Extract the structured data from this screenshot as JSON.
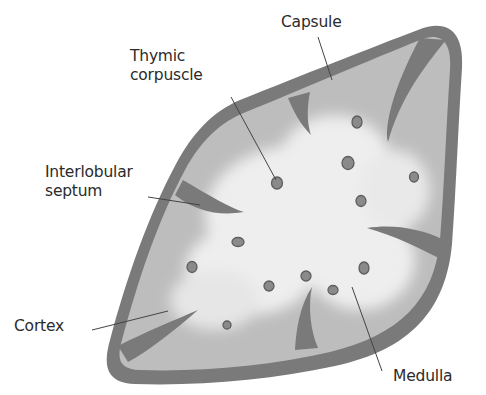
{
  "diagram": {
    "labels": {
      "capsule": "Capsule",
      "thymic_corpuscle_line1": "Thymic",
      "thymic_corpuscle_line2": "corpuscle",
      "interlobular_septum_line1": "Interlobular",
      "interlobular_septum_line2": "septum",
      "cortex": "Cortex",
      "medulla": "Medulla"
    },
    "colors": {
      "capsule": "#7a7a7a",
      "cortex": "#bdbdbd",
      "medulla": "#ececec",
      "corpuscle": "#8a8a8a",
      "corpuscle_outline": "#5e5e5e",
      "leader_line": "#444444",
      "text": "#2b2b2b"
    }
  }
}
